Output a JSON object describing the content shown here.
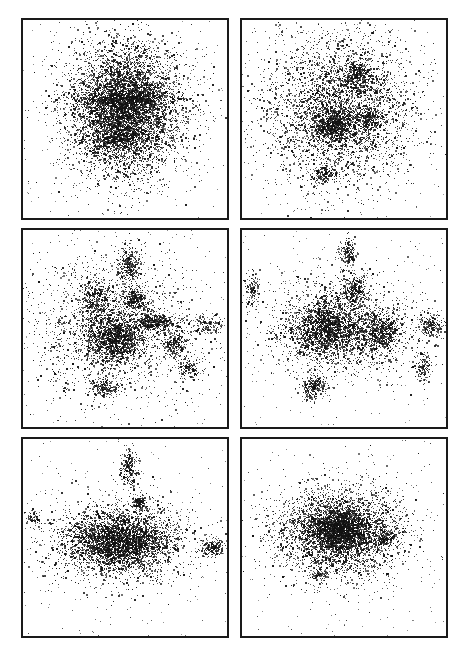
{
  "figure": {
    "background": "#ffffff",
    "ink": "#111111",
    "border": "#1a1a1a",
    "panels": [
      {
        "id": "panel-1",
        "row": 1,
        "col": 1,
        "x": 21,
        "y": 18,
        "w": 208,
        "h": 202,
        "seed": 11,
        "clusters": [
          {
            "cx": 0.5,
            "cy": 0.46,
            "sx": 0.15,
            "sy": 0.17,
            "n": 5200
          },
          {
            "cx": 0.5,
            "cy": 0.44,
            "sx": 0.08,
            "sy": 0.12,
            "n": 1600
          },
          {
            "cx": 0.45,
            "cy": 0.6,
            "sx": 0.06,
            "sy": 0.02,
            "n": 250
          },
          {
            "cx": 0.6,
            "cy": 0.4,
            "sx": 0.1,
            "sy": 0.02,
            "n": 300
          },
          {
            "cx": 0.4,
            "cy": 0.4,
            "sx": 0.1,
            "sy": 0.02,
            "n": 300
          }
        ]
      },
      {
        "id": "panel-2",
        "row": 1,
        "col": 2,
        "x": 240,
        "y": 18,
        "w": 208,
        "h": 202,
        "seed": 23,
        "clusters": [
          {
            "cx": 0.48,
            "cy": 0.45,
            "sx": 0.19,
            "sy": 0.19,
            "n": 3800
          },
          {
            "cx": 0.47,
            "cy": 0.52,
            "sx": 0.05,
            "sy": 0.04,
            "n": 500
          },
          {
            "cx": 0.56,
            "cy": 0.28,
            "sx": 0.04,
            "sy": 0.04,
            "n": 300
          },
          {
            "cx": 0.42,
            "cy": 0.55,
            "sx": 0.04,
            "sy": 0.03,
            "n": 300
          },
          {
            "cx": 0.62,
            "cy": 0.5,
            "sx": 0.03,
            "sy": 0.03,
            "n": 200
          },
          {
            "cx": 0.4,
            "cy": 0.78,
            "sx": 0.03,
            "sy": 0.02,
            "n": 150
          }
        ]
      },
      {
        "id": "panel-3",
        "row": 2,
        "col": 1,
        "x": 21,
        "y": 228,
        "w": 208,
        "h": 201,
        "seed": 37,
        "clusters": [
          {
            "cx": 0.45,
            "cy": 0.55,
            "sx": 0.07,
            "sy": 0.06,
            "n": 1400
          },
          {
            "cx": 0.45,
            "cy": 0.5,
            "sx": 0.22,
            "sy": 0.18,
            "n": 2000
          },
          {
            "cx": 0.65,
            "cy": 0.47,
            "sx": 0.05,
            "sy": 0.02,
            "n": 400
          },
          {
            "cx": 0.55,
            "cy": 0.35,
            "sx": 0.03,
            "sy": 0.03,
            "n": 300
          },
          {
            "cx": 0.52,
            "cy": 0.18,
            "sx": 0.03,
            "sy": 0.05,
            "n": 300
          },
          {
            "cx": 0.75,
            "cy": 0.58,
            "sx": 0.03,
            "sy": 0.03,
            "n": 250
          },
          {
            "cx": 0.36,
            "cy": 0.35,
            "sx": 0.04,
            "sy": 0.05,
            "n": 300
          },
          {
            "cx": 0.4,
            "cy": 0.8,
            "sx": 0.04,
            "sy": 0.02,
            "n": 200
          },
          {
            "cx": 0.82,
            "cy": 0.7,
            "sx": 0.03,
            "sy": 0.03,
            "n": 150
          },
          {
            "cx": 0.9,
            "cy": 0.48,
            "sx": 0.04,
            "sy": 0.03,
            "n": 150
          }
        ]
      },
      {
        "id": "panel-4",
        "row": 2,
        "col": 2,
        "x": 240,
        "y": 228,
        "w": 208,
        "h": 201,
        "seed": 51,
        "clusters": [
          {
            "cx": 0.42,
            "cy": 0.5,
            "sx": 0.09,
            "sy": 0.07,
            "n": 1800
          },
          {
            "cx": 0.68,
            "cy": 0.52,
            "sx": 0.05,
            "sy": 0.05,
            "n": 700
          },
          {
            "cx": 0.48,
            "cy": 0.5,
            "sx": 0.2,
            "sy": 0.14,
            "n": 1500
          },
          {
            "cx": 0.55,
            "cy": 0.3,
            "sx": 0.03,
            "sy": 0.04,
            "n": 300
          },
          {
            "cx": 0.52,
            "cy": 0.12,
            "sx": 0.02,
            "sy": 0.04,
            "n": 200
          },
          {
            "cx": 0.35,
            "cy": 0.8,
            "sx": 0.03,
            "sy": 0.03,
            "n": 250
          },
          {
            "cx": 0.93,
            "cy": 0.49,
            "sx": 0.03,
            "sy": 0.03,
            "n": 200
          },
          {
            "cx": 0.89,
            "cy": 0.7,
            "sx": 0.02,
            "sy": 0.04,
            "n": 150
          },
          {
            "cx": 0.05,
            "cy": 0.3,
            "sx": 0.02,
            "sy": 0.05,
            "n": 120
          }
        ]
      },
      {
        "id": "panel-5",
        "row": 3,
        "col": 1,
        "x": 21,
        "y": 437,
        "w": 208,
        "h": 201,
        "seed": 67,
        "clusters": [
          {
            "cx": 0.47,
            "cy": 0.52,
            "sx": 0.12,
            "sy": 0.07,
            "n": 3200
          },
          {
            "cx": 0.47,
            "cy": 0.52,
            "sx": 0.22,
            "sy": 0.12,
            "n": 1300
          },
          {
            "cx": 0.52,
            "cy": 0.15,
            "sx": 0.02,
            "sy": 0.05,
            "n": 250
          },
          {
            "cx": 0.57,
            "cy": 0.32,
            "sx": 0.02,
            "sy": 0.02,
            "n": 150
          },
          {
            "cx": 0.93,
            "cy": 0.55,
            "sx": 0.03,
            "sy": 0.02,
            "n": 200
          },
          {
            "cx": 0.05,
            "cy": 0.4,
            "sx": 0.02,
            "sy": 0.02,
            "n": 60
          }
        ]
      },
      {
        "id": "panel-6",
        "row": 3,
        "col": 2,
        "x": 240,
        "y": 437,
        "w": 208,
        "h": 201,
        "seed": 83,
        "clusters": [
          {
            "cx": 0.48,
            "cy": 0.46,
            "sx": 0.08,
            "sy": 0.06,
            "n": 2200
          },
          {
            "cx": 0.48,
            "cy": 0.48,
            "sx": 0.17,
            "sy": 0.12,
            "n": 3200
          },
          {
            "cx": 0.7,
            "cy": 0.5,
            "sx": 0.02,
            "sy": 0.02,
            "n": 120
          },
          {
            "cx": 0.38,
            "cy": 0.68,
            "sx": 0.02,
            "sy": 0.02,
            "n": 80
          }
        ]
      }
    ]
  }
}
